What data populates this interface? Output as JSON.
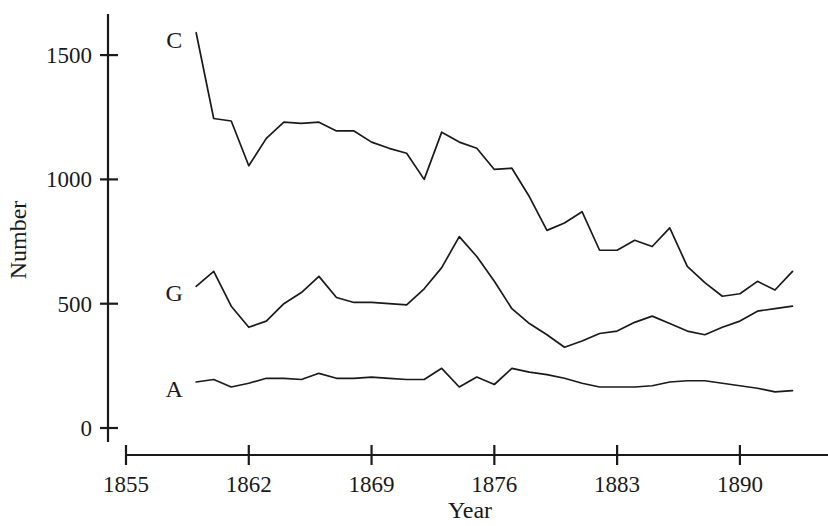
{
  "chart_data": {
    "type": "line",
    "title": "",
    "xlabel": "Year",
    "ylabel": "Number",
    "xlim": [
      1855,
      1894
    ],
    "ylim": [
      0,
      1620
    ],
    "grid": false,
    "legend": "inline-labels-at-series-start",
    "xticks": [
      "1855",
      "1862",
      "1869",
      "1876",
      "1883",
      "1890"
    ],
    "xtick_values": [
      1855,
      1862,
      1869,
      1876,
      1883,
      1890
    ],
    "yticks": [
      "0",
      "500",
      "1000",
      "1500"
    ],
    "ytick_values": [
      0,
      500,
      1000,
      1500
    ],
    "series": [
      {
        "name": "C",
        "label": "C",
        "color": "#1a1a1a",
        "x": [
          1859,
          1860,
          1861,
          1862,
          1863,
          1864,
          1865,
          1866,
          1867,
          1868,
          1869,
          1870,
          1871,
          1872,
          1873,
          1874,
          1875,
          1876,
          1877,
          1878,
          1879,
          1880,
          1881,
          1882,
          1883,
          1884,
          1885,
          1886,
          1887,
          1888,
          1889,
          1890,
          1891,
          1892,
          1893
        ],
        "values": [
          1590,
          1245,
          1235,
          1055,
          1165,
          1230,
          1225,
          1230,
          1195,
          1195,
          1150,
          1125,
          1105,
          1000,
          1190,
          1150,
          1125,
          1040,
          1045,
          930,
          795,
          825,
          870,
          715,
          715,
          755,
          730,
          805,
          650,
          585,
          530,
          540,
          590,
          555,
          630
        ]
      },
      {
        "name": "G",
        "label": "G",
        "color": "#1a1a1a",
        "x": [
          1859,
          1860,
          1861,
          1862,
          1863,
          1864,
          1865,
          1866,
          1867,
          1868,
          1869,
          1870,
          1871,
          1872,
          1873,
          1874,
          1875,
          1876,
          1877,
          1878,
          1879,
          1880,
          1881,
          1882,
          1883,
          1884,
          1885,
          1886,
          1887,
          1888,
          1889,
          1890,
          1891,
          1892,
          1893
        ],
        "values": [
          570,
          630,
          490,
          405,
          430,
          500,
          545,
          610,
          525,
          505,
          505,
          500,
          495,
          560,
          645,
          770,
          690,
          590,
          480,
          420,
          375,
          325,
          350,
          380,
          390,
          425,
          450,
          420,
          390,
          375,
          405,
          430,
          470,
          480,
          490
        ]
      },
      {
        "name": "A",
        "label": "A",
        "color": "#1a1a1a",
        "x": [
          1859,
          1860,
          1861,
          1862,
          1863,
          1864,
          1865,
          1866,
          1867,
          1868,
          1869,
          1870,
          1871,
          1872,
          1873,
          1874,
          1875,
          1876,
          1877,
          1878,
          1879,
          1880,
          1881,
          1882,
          1883,
          1884,
          1885,
          1886,
          1887,
          1888,
          1889,
          1890,
          1891,
          1892,
          1893
        ],
        "values": [
          185,
          195,
          165,
          180,
          200,
          200,
          195,
          220,
          200,
          200,
          205,
          200,
          195,
          195,
          240,
          165,
          205,
          175,
          240,
          225,
          215,
          200,
          180,
          165,
          165,
          165,
          170,
          185,
          190,
          190,
          180,
          170,
          160,
          145,
          150
        ]
      }
    ]
  },
  "axes": {
    "y_title": "Number",
    "x_title": "Year"
  },
  "labels": {
    "c": "C",
    "g": "G",
    "a": "A"
  }
}
